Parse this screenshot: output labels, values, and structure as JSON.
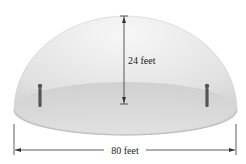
{
  "diagram": {
    "height_label": "24 feet",
    "width_label": "80 feet",
    "figures": [
      "person-left",
      "person-right"
    ]
  },
  "colors": {
    "dome_top": "#f2f2f2",
    "dome_side": "#d4d4d4",
    "floor": "#cfcfcf",
    "line": "#333333"
  }
}
